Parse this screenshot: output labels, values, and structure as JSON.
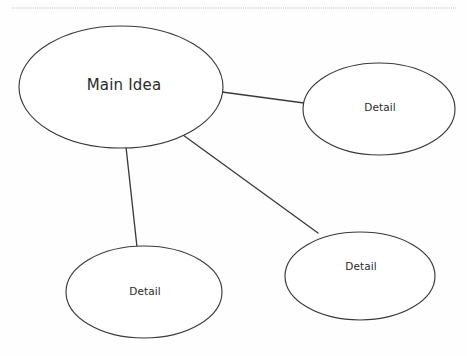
{
  "document": {
    "title": "Concept Map Graphic Organizer",
    "background_color": "#fefefe",
    "stroke_color": "#3a3a3a",
    "text_color": "#2b2b2b",
    "divider_color": "#b9b9b9"
  },
  "divider": {
    "name": "dotted-rule",
    "style": "dotted",
    "x1": 12,
    "x2": 456,
    "y": 8
  },
  "nodes": [
    {
      "id": "main-idea",
      "label": "Main Idea",
      "role": "central",
      "cx": 121,
      "cy": 87,
      "rx": 102,
      "ry": 61,
      "label_x": 124,
      "label_y": 85
    },
    {
      "id": "detail-right",
      "label": "Detail",
      "role": "supporting",
      "cx": 379,
      "cy": 109,
      "rx": 76,
      "ry": 46,
      "label_x": 380,
      "label_y": 108
    },
    {
      "id": "detail-bottom-left",
      "label": "Detail",
      "role": "supporting",
      "cx": 144,
      "cy": 292,
      "rx": 78,
      "ry": 46,
      "label_x": 145,
      "label_y": 292
    },
    {
      "id": "detail-bottom-right",
      "label": "Detail",
      "role": "supporting",
      "cx": 360,
      "cy": 276,
      "rx": 75,
      "ry": 44,
      "label_x": 361,
      "label_y": 267
    }
  ],
  "connectors": [
    {
      "id": "main-to-detail-right",
      "from": "main-idea",
      "to": "detail-right",
      "x1": 222,
      "y1": 92,
      "x2": 304,
      "y2": 103
    },
    {
      "id": "main-to-detail-bottom-left",
      "from": "main-idea",
      "to": "detail-bottom-left",
      "x1": 126,
      "y1": 147,
      "x2": 137,
      "y2": 247
    },
    {
      "id": "main-to-detail-bottom-right",
      "from": "main-idea",
      "to": "detail-bottom-right",
      "x1": 183,
      "y1": 135,
      "x2": 318,
      "y2": 233
    }
  ]
}
